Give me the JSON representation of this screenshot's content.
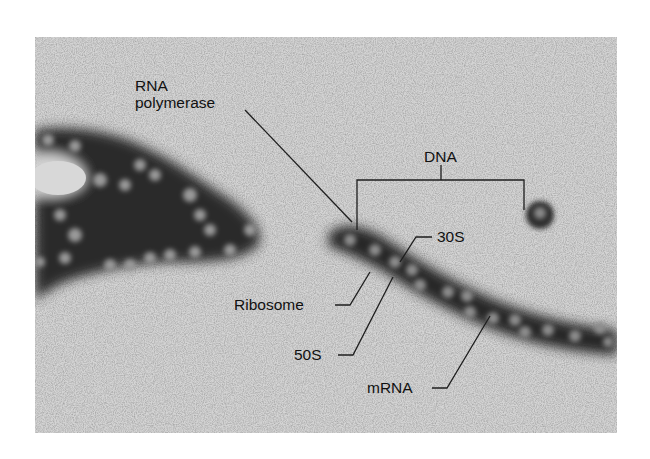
{
  "figure": {
    "colors": {
      "background": "#ffffff",
      "micrograph_base": "#cfcfcf",
      "stain_dark": "#1a1a1a",
      "label_text": "#111111",
      "leader_line": "#1e1e1e"
    }
  },
  "labels": {
    "rna_polymerase_line1": "RNA",
    "rna_polymerase_line2": "polymerase",
    "dna": "DNA",
    "s30": "30S",
    "ribosome": "Ribosome",
    "s50": "50S",
    "mrna": "mRNA"
  }
}
